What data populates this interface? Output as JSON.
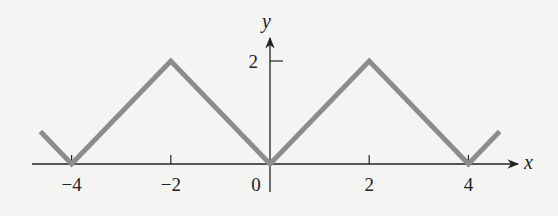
{
  "chart_data": {
    "type": "line",
    "title": "",
    "xlabel": "x",
    "ylabel": "y",
    "xlim": [
      -4.7,
      4.7
    ],
    "ylim": [
      0,
      2.4
    ],
    "grid": false,
    "legend": null,
    "x_ticks": [
      -4,
      -2,
      0,
      2,
      4
    ],
    "x_tick_labels": [
      "−4",
      "−2",
      "0",
      "2",
      "4"
    ],
    "y_ticks": [
      2
    ],
    "y_tick_labels": [
      "2"
    ],
    "series": [
      {
        "name": "triangle wave",
        "color": "#8c8c8c",
        "x": [
          -4.63,
          -4,
          -2,
          0,
          2,
          4,
          4.63
        ],
        "y": [
          0.63,
          0,
          2,
          0,
          2,
          0,
          0.63
        ]
      }
    ]
  },
  "colors": {
    "background": "#f4f4f2",
    "axis": "#222222",
    "curve": "#8c8c8c"
  }
}
